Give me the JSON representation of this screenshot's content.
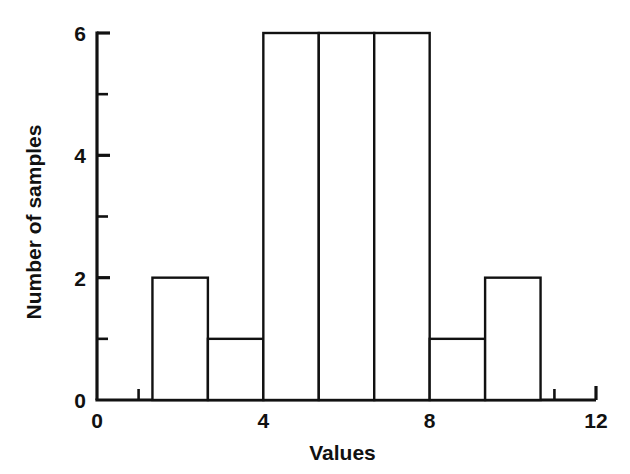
{
  "chart_data": {
    "type": "bar",
    "title": "",
    "subtitle": "",
    "xlabel": "Values",
    "ylabel": "Number of samples",
    "xlim": [
      0,
      12
    ],
    "ylim": [
      0,
      6
    ],
    "grid": false,
    "legend": null,
    "x_tick_labels": [
      "0",
      "4",
      "8",
      "12"
    ],
    "x_tick_values": [
      0,
      4,
      8,
      12
    ],
    "x_minor_tick_values": [
      1,
      2,
      3,
      5,
      6,
      7,
      9,
      10,
      11
    ],
    "y_tick_labels": [
      "0",
      "2",
      "4",
      "6"
    ],
    "y_tick_values": [
      0,
      2,
      4,
      6
    ],
    "y_minor_tick_values": [
      1,
      3,
      5
    ],
    "bin_width": 1.3333,
    "bars": [
      {
        "bin_start": 1.3333,
        "bin_end": 2.6667,
        "value": 2
      },
      {
        "bin_start": 2.6667,
        "bin_end": 4.0,
        "value": 1
      },
      {
        "bin_start": 4.0,
        "bin_end": 5.3333,
        "value": 6
      },
      {
        "bin_start": 5.3333,
        "bin_end": 6.6667,
        "value": 6
      },
      {
        "bin_start": 6.6667,
        "bin_end": 8.0,
        "value": 6
      },
      {
        "bin_start": 8.0,
        "bin_end": 9.3333,
        "value": 1
      },
      {
        "bin_start": 9.3333,
        "bin_end": 10.6667,
        "value": 2
      }
    ],
    "categories": [
      "1.33-2.67",
      "2.67-4.00",
      "4.00-5.33",
      "5.33-6.67",
      "6.67-8.00",
      "8.00-9.33",
      "9.33-10.67"
    ],
    "values": [
      2,
      1,
      6,
      6,
      6,
      1,
      2
    ],
    "colors": {
      "bar_stroke": "#111111",
      "bar_fill": "#ffffff",
      "axis": "#111111",
      "background": "#ffffff",
      "text": "#111111"
    }
  },
  "labels": {
    "x_title": "Values",
    "y_title": "Number of samples"
  }
}
